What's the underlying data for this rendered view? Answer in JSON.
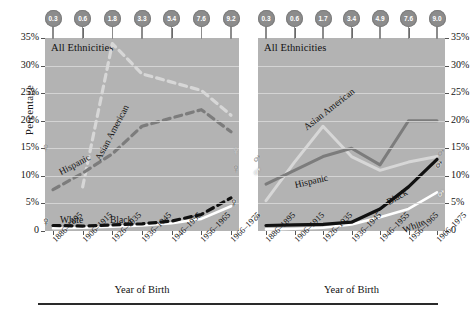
{
  "axis": {
    "ylabel": "Percentage",
    "xlabel_left": "Year of Birth",
    "xlabel_right": "Year of Birth",
    "yticks": [
      "35%",
      "30%",
      "25%",
      "20%",
      "15%",
      "10%",
      "5%",
      "0"
    ],
    "yticks_right": [
      "35%",
      "30%",
      "25%",
      "20%",
      "15%",
      "10%",
      "5%",
      "0"
    ],
    "xticks": [
      "1886–1895",
      "1906–1915",
      "1926–1935",
      "1936–1945",
      "1946–1955",
      "1956–1965",
      "1966–1975"
    ]
  },
  "panels": {
    "left": {
      "title": "All Ethnicities",
      "sex_symbol": "♀",
      "pins": [
        "0.3",
        "0.6",
        "1.8",
        "3.3",
        "5.4",
        "7.6",
        "9.2"
      ],
      "curve_labels": {
        "asian": "Asian American",
        "hispanic": "Hispanic",
        "white": "White",
        "black": "Black"
      }
    },
    "right": {
      "title": "All Ethnicities",
      "sex_symbol": "♂",
      "pins": [
        "0.3",
        "0.6",
        "1.7",
        "3.4",
        "4.9",
        "7.6",
        "9.0"
      ],
      "curve_labels": {
        "asian": "Asian American",
        "hispanic": "Hispanic",
        "white": "White",
        "black": "Black"
      }
    }
  },
  "colors": {
    "panel_background": "#b3b3b3",
    "gridline": "#d9d9d9",
    "asian_american": "#d7d7d7",
    "hispanic": "#7c7c7c",
    "black_series": "#111111",
    "white_series": "#ffffff",
    "pin": "#8c8c8c"
  },
  "chart_data": {
    "type": "line",
    "title": "All Ethnicities",
    "xlabel": "Year of Birth",
    "ylabel": "Percentage",
    "ylim": [
      0,
      35
    ],
    "grid": true,
    "legend": "inline-curve-labels",
    "categories": [
      "1886–1895",
      "1906–1915",
      "1926–1935",
      "1936–1945",
      "1946–1955",
      "1956–1965",
      "1966–1975"
    ],
    "panels": [
      {
        "name": "Female",
        "symbol": "♀",
        "pin_values": [
          0.3,
          0.6,
          1.8,
          3.3,
          5.4,
          7.6,
          9.2
        ],
        "series": [
          {
            "name": "Asian American",
            "style": "dashed-light",
            "values": [
              null,
              8.0,
              34.0,
              28.5,
              27.0,
              25.5,
              21.0
            ]
          },
          {
            "name": "Hispanic",
            "style": "dashed-gray",
            "values": [
              7.5,
              10.5,
              14.0,
              19.0,
              20.5,
              22.0,
              18.0
            ]
          },
          {
            "name": "White",
            "style": "solid-white",
            "values": [
              0.5,
              0.6,
              0.8,
              1.0,
              1.4,
              2.2,
              4.5
            ]
          },
          {
            "name": "Black",
            "style": "dashed-black",
            "values": [
              1.0,
              0.9,
              1.1,
              1.3,
              1.8,
              3.0,
              6.0
            ]
          }
        ]
      },
      {
        "name": "Male",
        "symbol": "♂",
        "pin_values": [
          0.3,
          0.6,
          1.7,
          3.4,
          4.9,
          7.6,
          9.0
        ],
        "series": [
          {
            "name": "Asian American",
            "style": "solid-light",
            "values": [
              5.5,
              12.5,
              19.0,
              13.5,
              11.0,
              12.5,
              13.5
            ]
          },
          {
            "name": "Hispanic",
            "style": "solid-gray",
            "values": [
              8.5,
              11.0,
              13.5,
              15.0,
              12.0,
              20.0,
              20.0
            ]
          },
          {
            "name": "White",
            "style": "solid-white",
            "values": [
              0.3,
              0.4,
              0.6,
              1.2,
              2.5,
              4.0,
              7.0
            ]
          },
          {
            "name": "Black",
            "style": "solid-black",
            "values": [
              1.0,
              1.1,
              1.2,
              1.6,
              4.0,
              8.0,
              13.0
            ]
          }
        ]
      }
    ]
  }
}
